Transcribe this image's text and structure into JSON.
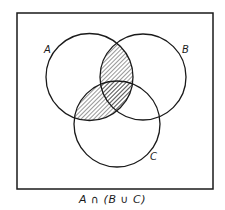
{
  "diagram": {
    "type": "venn",
    "universe_box": {
      "x": 17,
      "y": 13,
      "width": 196,
      "height": 176
    },
    "sets": [
      {
        "name": "A",
        "label": "A",
        "cx": 89.5,
        "cy": 77,
        "r": 43.5,
        "label_x": 44,
        "label_y": 45
      },
      {
        "name": "B",
        "label": "B",
        "cx": 143,
        "cy": 77,
        "r": 43,
        "label_x": 182,
        "label_y": 45
      },
      {
        "name": "C",
        "label": "C",
        "cx": 117,
        "cy": 124,
        "r": 43,
        "label_x": 150,
        "label_y": 152
      }
    ],
    "shaded_region": "A ∩ (B ∪ C)",
    "hatch_style": "diagonal lines",
    "stroke_color": "#1a1a1a",
    "caption": "A ∩ (B ∪ C)"
  }
}
